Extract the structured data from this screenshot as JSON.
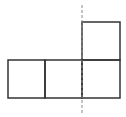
{
  "diagram": {
    "stroke_color": "#333333",
    "dash_color": "#888888",
    "background": "#ffffff",
    "squares": [
      {
        "x": 8,
        "y": 60,
        "w": 37,
        "h": 38
      },
      {
        "x": 45,
        "y": 60,
        "w": 37,
        "h": 38
      },
      {
        "x": 82,
        "y": 60,
        "w": 38,
        "h": 38
      },
      {
        "x": 82,
        "y": 22,
        "w": 38,
        "h": 38
      }
    ],
    "dashed_line": {
      "x": 82,
      "y1": 5,
      "y2": 115
    }
  }
}
